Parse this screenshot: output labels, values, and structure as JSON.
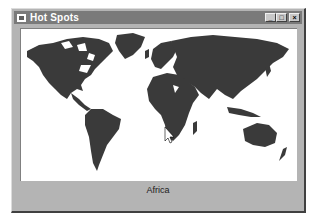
{
  "window": {
    "title": "Hot Spots",
    "controls": {
      "minimize": "_",
      "maximize": "□",
      "close": "×"
    }
  },
  "map": {
    "land_color": "#3a3a3a",
    "ocean_color": "#ffffff",
    "hovered_region": "Africa",
    "cursor": "arrow-pointer"
  },
  "status": {
    "region_label": "Africa"
  }
}
